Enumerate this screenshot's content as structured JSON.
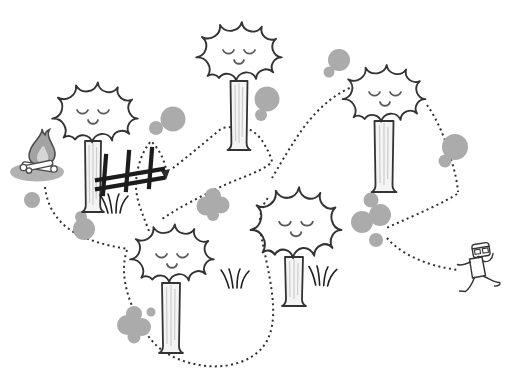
{
  "scene": {
    "kind": "cartoon forest trail illustration",
    "background": "#ffffff",
    "trail": {
      "style": "dotted line",
      "start": "campfire (left side)",
      "end": "running person (right side)",
      "direction_marker": "small arrowhead pointing down beside the fence",
      "weaves_behind": [
        "tree canopies",
        "tree trunks",
        "gray bushes"
      ]
    }
  },
  "colors": {
    "outline": "#333333",
    "trail": "#2f2f2f",
    "bush": "#ababab",
    "canopy_fill": "#ffffff",
    "trunk_fill": "#f4f4f4",
    "trunk_streak": "#cccccc",
    "face": "#5a5a5a",
    "fence": "#1c1c1c",
    "fire_shadow": "#b2b2b2",
    "flame_outer": "#a3a3a3",
    "flame_inner": "#d6d6d6",
    "log_outline": "#4a4a4a"
  },
  "trees": [
    {
      "id": "tree-top-left",
      "canopy_center": [
        95,
        111
      ],
      "trunk_base_y": 212,
      "expression": "closed eyes, smile"
    },
    {
      "id": "tree-top-center",
      "canopy_center": [
        239,
        50
      ],
      "trunk_base_y": 150,
      "expression": "closed eyes, smile"
    },
    {
      "id": "tree-top-right",
      "canopy_center": [
        384,
        92
      ],
      "trunk_base_y": 192,
      "expression": "closed eyes, smile"
    },
    {
      "id": "tree-bottom-left",
      "canopy_center": [
        172,
        252
      ],
      "trunk_base_y": 353,
      "expression": "closed eyes, smile"
    },
    {
      "id": "tree-bottom-center",
      "canopy_center": [
        296,
        221
      ],
      "trunk_base_y": 306,
      "expression": "closed eyes, smile"
    }
  ],
  "bushes": [
    {
      "id": "bush-1",
      "at": [
        168,
        122
      ]
    },
    {
      "id": "bush-2",
      "at": [
        265,
        103
      ]
    },
    {
      "id": "bush-3",
      "at": [
        336,
        63
      ]
    },
    {
      "id": "bush-4",
      "at": [
        452,
        150
      ]
    },
    {
      "id": "bush-5",
      "at": [
        371,
        219
      ]
    },
    {
      "id": "bush-6",
      "at": [
        83,
        226
      ]
    },
    {
      "id": "bush-7",
      "at": [
        32,
        200
      ]
    },
    {
      "id": "bush-8",
      "at": [
        136,
        324
      ]
    },
    {
      "id": "bush-9",
      "at": [
        213,
        205
      ]
    }
  ],
  "campfire": {
    "at": [
      41,
      150
    ],
    "parts": [
      "flame",
      "inner flame",
      "logs",
      "ground shadow"
    ]
  },
  "fence": {
    "at": [
      130,
      172
    ],
    "posts": 3,
    "rails": 2
  },
  "grass_tufts": [
    {
      "at": [
        116,
        203
      ]
    },
    {
      "at": [
        238,
        279
      ]
    },
    {
      "at": [
        326,
        276
      ]
    }
  ],
  "person": {
    "at": [
      480,
      266
    ],
    "pose": "running",
    "details": [
      "square head",
      "glasses",
      "open mouth",
      "sleeveless shirt"
    ]
  }
}
